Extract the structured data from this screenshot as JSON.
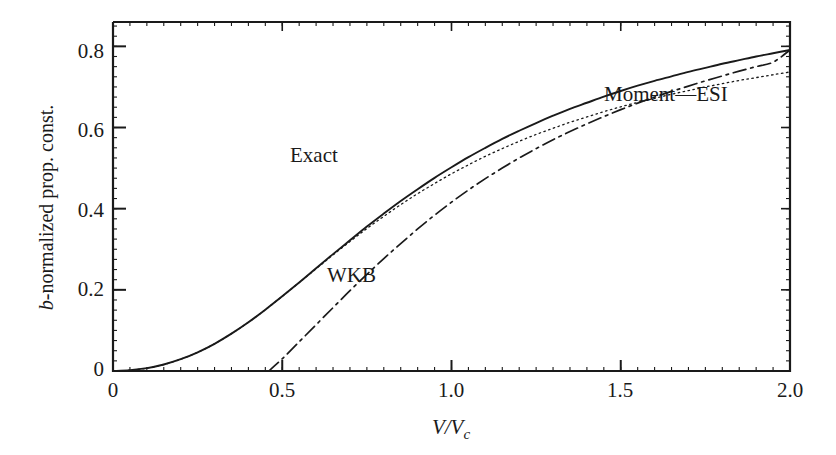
{
  "figure": {
    "background_color": "#ffffff",
    "line_color": "#1a1a1a"
  },
  "axes": {
    "x": {
      "label_prefix": "V/V",
      "label_subscript": "c",
      "label_full": "V/Vc",
      "min": 0.0,
      "max": 2.0,
      "tick_labels": [
        "0",
        "0.5",
        "1.0",
        "1.5",
        "2.0"
      ],
      "tick_values": [
        0.0,
        0.5,
        1.0,
        1.5,
        2.0
      ],
      "minor_tick_step": 0.05
    },
    "y": {
      "label_italic_prefix": "b",
      "label_rest": "-normalized prop. const.",
      "label_full": "b-normalized prop. const.",
      "min": 0.0,
      "max": 0.86,
      "tick_labels": [
        "0",
        "0.2",
        "0.4",
        "0.6",
        "0.8"
      ],
      "tick_values": [
        0.0,
        0.2,
        0.4,
        0.6,
        0.8
      ],
      "minor_tick_step": 0.025
    }
  },
  "annotations": [
    {
      "id": "exact",
      "text": "Exact"
    },
    {
      "id": "wkb",
      "text": "WKB"
    },
    {
      "id": "moment",
      "text": "Moment—ESI"
    }
  ],
  "chart_data": {
    "type": "line",
    "title": "",
    "xlabel": "V/Vc",
    "ylabel": "b-normalized prop. const.",
    "xlim": [
      0.0,
      2.0
    ],
    "ylim": [
      0.0,
      0.86
    ],
    "grid": false,
    "legend": "inline annotations",
    "xticks": [
      0.0,
      0.5,
      1.0,
      1.5,
      2.0
    ],
    "yticks": [
      0.0,
      0.2,
      0.4,
      0.6,
      0.8
    ],
    "series": [
      {
        "name": "Exact",
        "style": "solid",
        "x": [
          0.0,
          0.05,
          0.1,
          0.15,
          0.2,
          0.25,
          0.3,
          0.35,
          0.4,
          0.45,
          0.5,
          0.55,
          0.6,
          0.65,
          0.7,
          0.75,
          0.8,
          0.85,
          0.9,
          0.95,
          1.0,
          1.05,
          1.1,
          1.15,
          1.2,
          1.25,
          1.3,
          1.35,
          1.4,
          1.45,
          1.5,
          1.55,
          1.6,
          1.65,
          1.7,
          1.75,
          1.8,
          1.85,
          1.9,
          1.95,
          2.0
        ],
        "y": [
          0.0,
          0.002,
          0.007,
          0.016,
          0.029,
          0.046,
          0.067,
          0.092,
          0.12,
          0.151,
          0.184,
          0.218,
          0.253,
          0.288,
          0.322,
          0.356,
          0.388,
          0.419,
          0.448,
          0.476,
          0.502,
          0.527,
          0.55,
          0.572,
          0.592,
          0.611,
          0.629,
          0.646,
          0.661,
          0.676,
          0.69,
          0.703,
          0.715,
          0.726,
          0.737,
          0.747,
          0.757,
          0.766,
          0.775,
          0.783,
          0.791
        ]
      },
      {
        "name": "Moment—ESI",
        "style": "dotted",
        "x": [
          0.0,
          0.05,
          0.1,
          0.15,
          0.2,
          0.25,
          0.3,
          0.35,
          0.4,
          0.45,
          0.5,
          0.55,
          0.6,
          0.65,
          0.7,
          0.75,
          0.8,
          0.85,
          0.9,
          0.95,
          1.0,
          1.05,
          1.1,
          1.15,
          1.2,
          1.25,
          1.3,
          1.35,
          1.4,
          1.45,
          1.5,
          1.55,
          1.6,
          1.65,
          1.7,
          1.75,
          1.8,
          1.85,
          1.9,
          1.95,
          2.0
        ],
        "y": [
          0.0,
          0.002,
          0.007,
          0.016,
          0.029,
          0.046,
          0.067,
          0.092,
          0.12,
          0.151,
          0.184,
          0.218,
          0.252,
          0.286,
          0.319,
          0.351,
          0.381,
          0.41,
          0.437,
          0.462,
          0.486,
          0.508,
          0.529,
          0.548,
          0.566,
          0.583,
          0.598,
          0.613,
          0.626,
          0.639,
          0.651,
          0.662,
          0.672,
          0.682,
          0.691,
          0.7,
          0.708,
          0.716,
          0.723,
          0.73,
          0.737
        ]
      },
      {
        "name": "WKB",
        "style": "dash-dot",
        "x": [
          0.46,
          0.5,
          0.55,
          0.6,
          0.65,
          0.7,
          0.75,
          0.8,
          0.85,
          0.9,
          0.95,
          1.0,
          1.05,
          1.1,
          1.15,
          1.2,
          1.25,
          1.3,
          1.35,
          1.4,
          1.45,
          1.5,
          1.55,
          1.6,
          1.65,
          1.7,
          1.75,
          1.8,
          1.85,
          1.9,
          1.95,
          2.0
        ],
        "y": [
          0.0,
          0.03,
          0.072,
          0.114,
          0.156,
          0.198,
          0.238,
          0.277,
          0.314,
          0.35,
          0.384,
          0.416,
          0.446,
          0.474,
          0.5,
          0.525,
          0.548,
          0.57,
          0.59,
          0.609,
          0.627,
          0.644,
          0.66,
          0.675,
          0.689,
          0.702,
          0.715,
          0.727,
          0.739,
          0.75,
          0.761,
          0.791
        ]
      }
    ]
  }
}
